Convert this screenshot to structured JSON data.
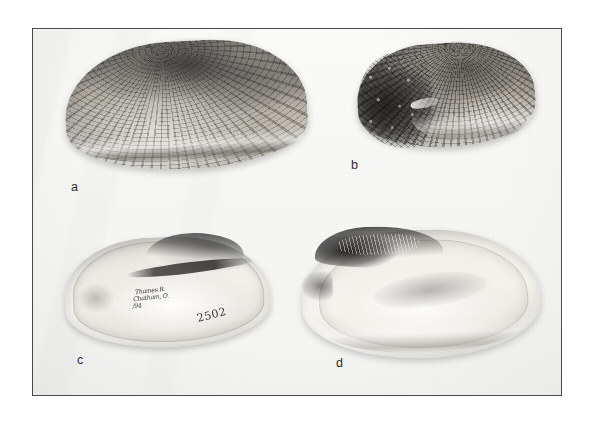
{
  "figure": {
    "kind": "photographic-plate",
    "background_color": "#ffffff",
    "plate_background_color": "#f7f7f5",
    "border_color": "#4a4a4a"
  },
  "panels": [
    {
      "id": "a",
      "caption": "a",
      "view": "exterior-left-valve",
      "notes": "large elongate shell, concentric growth rings and dark radial striations"
    },
    {
      "id": "b",
      "caption": "b",
      "view": "exterior-oblique",
      "notes": "smaller shell, tuberculate sculpture on anterior end"
    },
    {
      "id": "c",
      "caption": "c",
      "view": "interior-nacre",
      "notes": "interior with handwritten museum locality label and catalogue number"
    },
    {
      "id": "d",
      "caption": "d",
      "view": "interior-nacre",
      "notes": "large interior, dark hinge and beak cavity at upper left"
    }
  ],
  "specimen_label": {
    "line1": "Thames R.",
    "line2": "Chatham, O.",
    "line3": "/94",
    "catalog_number": "2502"
  }
}
